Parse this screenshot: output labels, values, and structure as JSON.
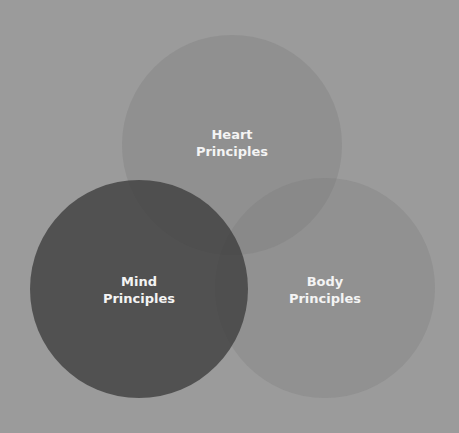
{
  "diagram": {
    "type": "venn",
    "background": "#9b9b9b",
    "circles": [
      {
        "id": "heart",
        "line1": "Heart",
        "line2": "Principles",
        "cx": 232,
        "cy": 145,
        "r": 110,
        "color": "rgba(120,120,120,0.30)",
        "label_x": 232,
        "label_y": 143
      },
      {
        "id": "mind",
        "line1": "Mind",
        "line2": "Principles",
        "cx": 139,
        "cy": 289,
        "r": 109,
        "color": "rgba(60,60,60,0.78)",
        "label_x": 139,
        "label_y": 290
      },
      {
        "id": "body",
        "line1": "Body",
        "line2": "Principles",
        "cx": 325,
        "cy": 288,
        "r": 110,
        "color": "rgba(120,120,120,0.28)",
        "label_x": 325,
        "label_y": 290
      }
    ],
    "text_color": "#f4f4f4"
  }
}
